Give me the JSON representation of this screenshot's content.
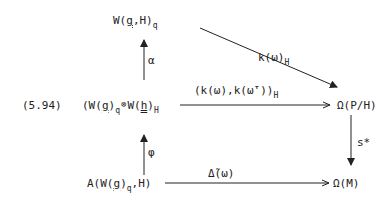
{
  "equation_label": "(5.94)",
  "nodes": {
    "top": {
      "main": "W(",
      "g": "g",
      "rest": ",H)",
      "sub": "q"
    },
    "middle_left": {
      "p1": "(W(",
      "g": "g",
      "p2": ")",
      "sub1": "q",
      "otimes": "⊗",
      "p3": "W(",
      "h": "h",
      "p4": ")",
      "sub2": "H"
    },
    "middle_right": {
      "text": "Ω(P/H)"
    },
    "bottom_left": {
      "p1": "A(W(",
      "g": "g",
      "p2": ")",
      "sub": "q",
      "p3": ",H)"
    },
    "bottom_right": {
      "text": "Ω(M)"
    }
  },
  "arrows": {
    "alpha": {
      "label": "α"
    },
    "phi": {
      "label": "φ"
    },
    "diagonal": {
      "label": "k(ω)",
      "sub": "H"
    },
    "middle": {
      "label": "(k(ω),k(ω̄'))",
      "sub": "H"
    },
    "s_star": {
      "label": "s*"
    },
    "bottom": {
      "label": "Δ̃(ω)"
    }
  }
}
